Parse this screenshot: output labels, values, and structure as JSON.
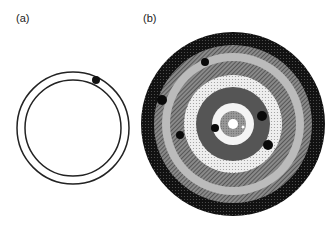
{
  "panels": [
    {
      "label": "(a)",
      "type": "annular-channel",
      "center": [
        73,
        128
      ],
      "outer_radius": 56,
      "inner_radius": 48,
      "stroke_color": "#222222",
      "particles": [
        {
          "x": 96,
          "y": 80,
          "r": 4
        }
      ]
    },
    {
      "label": "(b)",
      "type": "concentric-rings",
      "center": [
        233,
        124
      ],
      "rings": [
        {
          "r": 92,
          "fill": "#111111",
          "pattern": "dots-dark"
        },
        {
          "r": 79,
          "fill": "#777777",
          "pattern": "hatch"
        },
        {
          "r": 71,
          "fill": "#bbbbbb",
          "pattern": "solid-light"
        },
        {
          "r": 63,
          "fill": "#6a6a6a",
          "pattern": "hatch"
        },
        {
          "r": 49,
          "fill": "#dddddd",
          "pattern": "dots-light"
        },
        {
          "r": 37,
          "fill": "#555555",
          "pattern": "solid-dark"
        },
        {
          "r": 21,
          "fill": "#f4f4f4",
          "pattern": "solid-white"
        },
        {
          "r": 13,
          "fill": "#8a8a8a",
          "pattern": "dots-mid"
        },
        {
          "r": 5,
          "fill": "#ffffff",
          "pattern": "hole"
        }
      ],
      "particles": [
        {
          "x": 205,
          "y": 62,
          "r": 4
        },
        {
          "x": 162,
          "y": 100,
          "r": 5
        },
        {
          "x": 180,
          "y": 135,
          "r": 4
        },
        {
          "x": 215,
          "y": 128,
          "r": 4
        },
        {
          "x": 262,
          "y": 116,
          "r": 5
        },
        {
          "x": 268,
          "y": 145,
          "r": 5
        },
        {
          "x": 243,
          "y": 127,
          "r": 1.5,
          "fill": "#ffffff"
        }
      ]
    }
  ]
}
